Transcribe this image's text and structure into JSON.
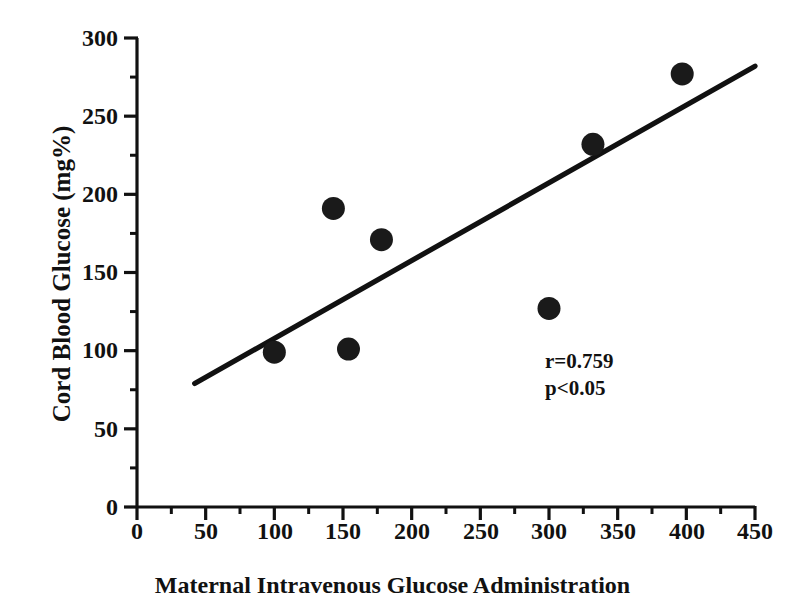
{
  "chart_data": {
    "type": "scatter",
    "title": "",
    "xlabel": "Maternal Intravenous Glucose Administration",
    "ylabel": "Cord Blood Glucose (mg%)",
    "xlim": [
      0,
      450
    ],
    "ylim": [
      0,
      300
    ],
    "grid": false,
    "legend": null,
    "x_major_ticks": [
      0,
      50,
      100,
      150,
      200,
      250,
      300,
      350,
      400,
      450
    ],
    "x_minor_ticks": [
      25,
      75,
      125,
      175,
      225,
      275,
      325,
      375,
      425
    ],
    "y_major_ticks": [
      0,
      50,
      100,
      150,
      200,
      250,
      300
    ],
    "y_minor_ticks": [
      25,
      75,
      125,
      175,
      225,
      275
    ],
    "x_tick_labels": [
      "0",
      "50",
      "100",
      "150",
      "200",
      "250",
      "300",
      "350",
      "400",
      "450"
    ],
    "y_tick_labels": [
      "0",
      "50",
      "100",
      "150",
      "200",
      "250",
      "300"
    ],
    "series": [
      {
        "name": "Cord blood glucose vs maternal glucose",
        "marker": "filled-circle",
        "color": "#1a1a1a",
        "points": [
          {
            "x": 100,
            "y": 99
          },
          {
            "x": 143,
            "y": 191
          },
          {
            "x": 154,
            "y": 101
          },
          {
            "x": 178,
            "y": 171
          },
          {
            "x": 300,
            "y": 127
          },
          {
            "x": 332,
            "y": 232
          },
          {
            "x": 397,
            "y": 277
          }
        ]
      }
    ],
    "trendline": {
      "name": "linear-regression-line",
      "color": "#111111",
      "x_start": 42,
      "y_start": 79,
      "x_end": 450,
      "y_end": 282
    },
    "annotations": {
      "correlation": "r=0.759",
      "pvalue": "p<0.05"
    }
  }
}
